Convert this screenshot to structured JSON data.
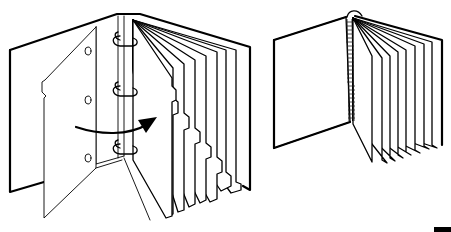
{
  "figure": {
    "width": 451,
    "height": 232,
    "background": "#ffffff",
    "line_color": "#000000",
    "panels": [
      {
        "id": "ring-binder",
        "description": "Three-ring binder with tabbed dividers; front divider being flipped left with arrow indicating page turn",
        "ring_count": 3,
        "divider_count": 8,
        "has_arrow": true
      },
      {
        "id": "spiral-book",
        "description": "Spiral/coil-bound book opened, pages fanned to the right",
        "page_count": 8
      }
    ],
    "corner_mark": {
      "x": 434,
      "y": 227,
      "width": 17,
      "height": 5,
      "color": "#000000"
    }
  }
}
